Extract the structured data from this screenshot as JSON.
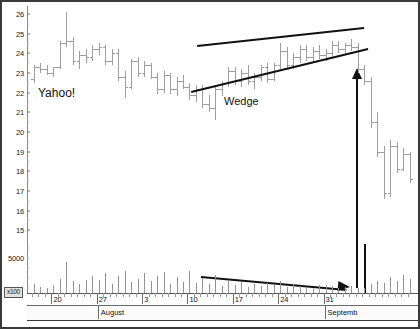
{
  "chart_data": {
    "type": "ohlc",
    "title": "Yahoo!",
    "xlabel": "",
    "ylabel": "",
    "ylim": [
      14.4,
      26.4
    ],
    "grid": false,
    "legend_position": "none",
    "y_ticks": [
      26,
      25,
      24,
      23,
      22,
      21,
      20,
      19,
      18,
      17,
      16,
      15
    ],
    "x_tick_labels": [
      "20",
      "27",
      "3",
      "10",
      "17",
      "24",
      "31"
    ],
    "month_bands": [
      "",
      "August",
      "Septemb"
    ],
    "volume_axis_label": "5000",
    "volume_scale_badge": "x100",
    "annotations": [
      {
        "text": "Yahoo!",
        "kind": "label"
      },
      {
        "text": "Wedge",
        "kind": "label"
      },
      {
        "kind": "trendline",
        "name": "wedge-upper",
        "x1": 195,
        "y1": 43,
        "x2": 362,
        "y2": 25
      },
      {
        "kind": "trendline",
        "name": "wedge-lower",
        "x1": 189,
        "y1": 89,
        "x2": 366,
        "y2": 46
      },
      {
        "kind": "arrow",
        "name": "breakout-arrow-up",
        "direction": "up"
      },
      {
        "kind": "arrow",
        "name": "volume-trend-arrow",
        "direction": "down-right"
      }
    ],
    "series": [
      {
        "name": "Price (OHLC)",
        "bars": [
          {
            "o": 22.7,
            "h": 23.4,
            "l": 22.5,
            "c": 23.3
          },
          {
            "o": 23.3,
            "h": 23.5,
            "l": 23.0,
            "c": 23.2
          },
          {
            "o": 23.2,
            "h": 23.4,
            "l": 22.9,
            "c": 23.0
          },
          {
            "o": 23.0,
            "h": 23.3,
            "l": 22.8,
            "c": 23.3
          },
          {
            "o": 23.3,
            "h": 24.6,
            "l": 23.2,
            "c": 24.5
          },
          {
            "o": 24.5,
            "h": 26.1,
            "l": 24.3,
            "c": 24.6
          },
          {
            "o": 24.6,
            "h": 24.8,
            "l": 23.4,
            "c": 23.6
          },
          {
            "o": 23.6,
            "h": 24.1,
            "l": 23.2,
            "c": 23.9
          },
          {
            "o": 23.9,
            "h": 24.2,
            "l": 23.5,
            "c": 23.8
          },
          {
            "o": 23.8,
            "h": 24.4,
            "l": 23.6,
            "c": 24.2
          },
          {
            "o": 24.2,
            "h": 24.5,
            "l": 23.9,
            "c": 24.3
          },
          {
            "o": 24.3,
            "h": 24.4,
            "l": 23.4,
            "c": 23.6
          },
          {
            "o": 23.6,
            "h": 24.2,
            "l": 23.4,
            "c": 24.0
          },
          {
            "o": 24.0,
            "h": 24.2,
            "l": 22.6,
            "c": 22.8
          },
          {
            "o": 22.8,
            "h": 23.1,
            "l": 21.7,
            "c": 22.3
          },
          {
            "o": 22.3,
            "h": 23.7,
            "l": 22.2,
            "c": 23.6
          },
          {
            "o": 23.6,
            "h": 23.8,
            "l": 22.8,
            "c": 23.0
          },
          {
            "o": 23.0,
            "h": 23.6,
            "l": 22.8,
            "c": 23.4
          },
          {
            "o": 23.4,
            "h": 23.5,
            "l": 22.7,
            "c": 22.8
          },
          {
            "o": 22.8,
            "h": 23.0,
            "l": 21.9,
            "c": 22.2
          },
          {
            "o": 22.2,
            "h": 23.1,
            "l": 22.0,
            "c": 22.9
          },
          {
            "o": 22.9,
            "h": 23.0,
            "l": 21.9,
            "c": 22.2
          },
          {
            "o": 22.2,
            "h": 22.8,
            "l": 21.8,
            "c": 22.6
          },
          {
            "o": 22.6,
            "h": 22.9,
            "l": 22.2,
            "c": 22.3
          },
          {
            "o": 22.3,
            "h": 22.5,
            "l": 21.6,
            "c": 21.9
          },
          {
            "o": 21.9,
            "h": 22.4,
            "l": 21.5,
            "c": 22.2
          },
          {
            "o": 22.2,
            "h": 22.4,
            "l": 21.2,
            "c": 21.4
          },
          {
            "o": 21.4,
            "h": 21.9,
            "l": 21.0,
            "c": 21.2
          },
          {
            "o": 21.2,
            "h": 22.4,
            "l": 20.6,
            "c": 22.2
          },
          {
            "o": 22.2,
            "h": 22.6,
            "l": 21.8,
            "c": 22.5
          },
          {
            "o": 22.5,
            "h": 23.3,
            "l": 22.3,
            "c": 23.1
          },
          {
            "o": 23.1,
            "h": 23.3,
            "l": 22.4,
            "c": 22.6
          },
          {
            "o": 22.6,
            "h": 23.2,
            "l": 22.3,
            "c": 23.0
          },
          {
            "o": 23.0,
            "h": 23.4,
            "l": 22.4,
            "c": 22.6
          },
          {
            "o": 22.6,
            "h": 23.0,
            "l": 22.2,
            "c": 22.8
          },
          {
            "o": 22.8,
            "h": 23.4,
            "l": 22.6,
            "c": 23.3
          },
          {
            "o": 23.3,
            "h": 23.5,
            "l": 22.5,
            "c": 22.7
          },
          {
            "o": 22.7,
            "h": 23.5,
            "l": 22.6,
            "c": 23.4
          },
          {
            "o": 23.4,
            "h": 24.5,
            "l": 23.2,
            "c": 24.1
          },
          {
            "o": 24.1,
            "h": 24.3,
            "l": 23.2,
            "c": 23.4
          },
          {
            "o": 23.4,
            "h": 24.0,
            "l": 23.2,
            "c": 23.8
          },
          {
            "o": 23.8,
            "h": 24.4,
            "l": 23.5,
            "c": 24.2
          },
          {
            "o": 24.2,
            "h": 24.4,
            "l": 23.6,
            "c": 23.8
          },
          {
            "o": 23.8,
            "h": 24.3,
            "l": 23.6,
            "c": 24.1
          },
          {
            "o": 24.1,
            "h": 24.4,
            "l": 23.7,
            "c": 23.9
          },
          {
            "o": 23.9,
            "h": 24.2,
            "l": 23.6,
            "c": 24.0
          },
          {
            "o": 24.0,
            "h": 24.6,
            "l": 23.8,
            "c": 24.4
          },
          {
            "o": 24.4,
            "h": 24.6,
            "l": 24.0,
            "c": 24.2
          },
          {
            "o": 24.2,
            "h": 24.5,
            "l": 23.9,
            "c": 24.4
          },
          {
            "o": 24.4,
            "h": 24.7,
            "l": 24.1,
            "c": 24.3
          },
          {
            "o": 24.3,
            "h": 24.5,
            "l": 23.0,
            "c": 23.2
          },
          {
            "o": 23.2,
            "h": 23.4,
            "l": 22.4,
            "c": 22.6
          },
          {
            "o": 22.6,
            "h": 22.8,
            "l": 20.2,
            "c": 20.5
          },
          {
            "o": 20.5,
            "h": 21.0,
            "l": 18.7,
            "c": 19.0
          },
          {
            "o": 19.0,
            "h": 19.3,
            "l": 16.6,
            "c": 16.9
          },
          {
            "o": 16.9,
            "h": 19.6,
            "l": 16.7,
            "c": 19.3
          },
          {
            "o": 19.3,
            "h": 19.5,
            "l": 17.9,
            "c": 18.1
          },
          {
            "o": 18.1,
            "h": 19.2,
            "l": 18.0,
            "c": 18.9
          },
          {
            "o": 18.9,
            "h": 19.0,
            "l": 17.4,
            "c": 17.6
          }
        ]
      },
      {
        "name": "Volume",
        "values": [
          9,
          6,
          5,
          7,
          14,
          30,
          12,
          9,
          13,
          17,
          13,
          20,
          9,
          17,
          22,
          11,
          14,
          20,
          12,
          17,
          21,
          9,
          16,
          11,
          22,
          10,
          15,
          9,
          18,
          7,
          12,
          8,
          11,
          6,
          9,
          7,
          10,
          8,
          12,
          6,
          9,
          7,
          6,
          5,
          8,
          6,
          7,
          5,
          6,
          7,
          5,
          48,
          9,
          12,
          10,
          16,
          12,
          18,
          14
        ]
      }
    ]
  }
}
